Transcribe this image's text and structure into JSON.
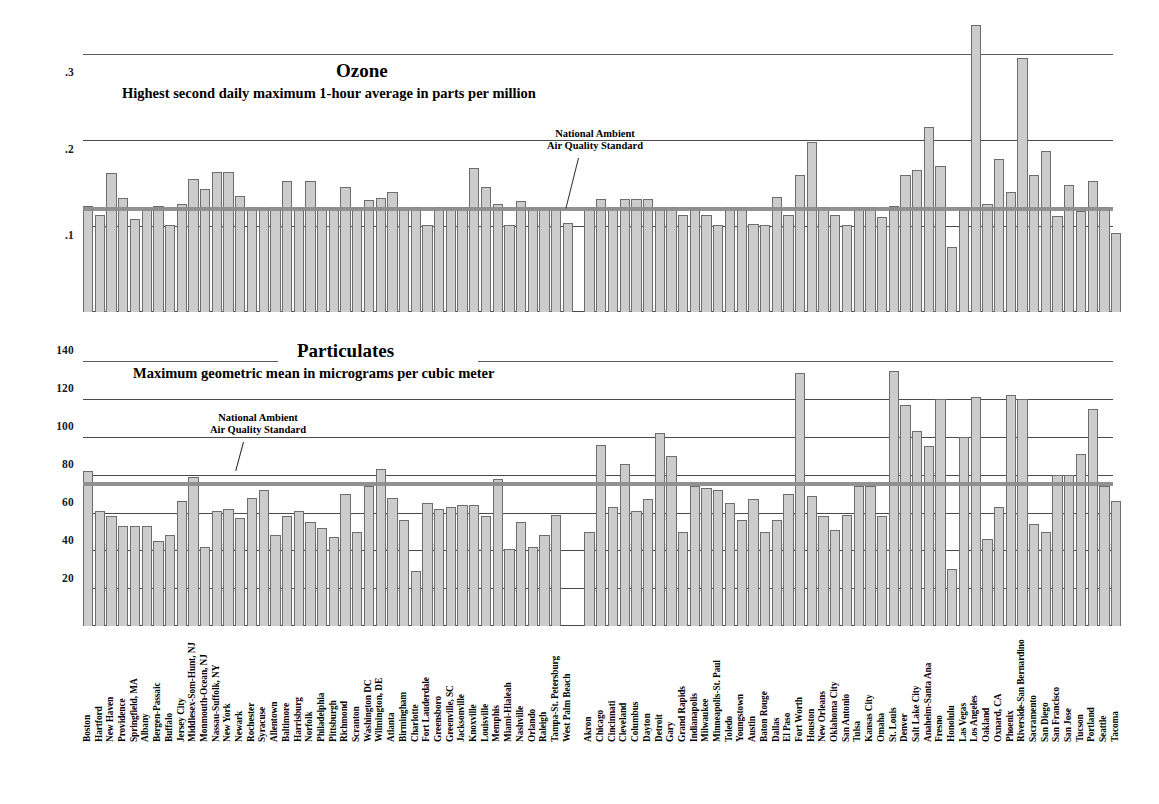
{
  "chart_data": [
    {
      "type": "bar",
      "title": "Ozone",
      "subtitle": "Highest second daily maximum 1-hour average in parts per million",
      "ylabel": "",
      "xlabel": "",
      "ylim": [
        0,
        0.34
      ],
      "yticks": [
        0.1,
        0.2,
        0.3
      ],
      "ytick_labels": [
        ".1",
        ".2",
        ".3"
      ],
      "grid": true,
      "annotation": "National Ambient\nAir Quality Standard",
      "annotation_lines": [
        "National Ambient",
        "Air Quality Standard"
      ],
      "reference_line": {
        "label": "National Ambient Air Quality Standard",
        "value": 0.12
      },
      "categories": [
        "Boston",
        "Hartford",
        "New Haven",
        "Providence",
        "Springfield, MA",
        "Albany",
        "Bergen-Passaic",
        "Buffalo",
        "Jersey City",
        "Middlesex-Som-Hunt, NJ",
        "Monmouth-Ocean, NJ",
        "Nassau-Suffolk, NY",
        "New York",
        "Newark",
        "Rochester",
        "Syracuse",
        "Allentown",
        "Baltimore",
        "Harrisburg",
        "Norfolk",
        "Philadelphia",
        "Pittsburgh",
        "Richmond",
        "Scranton",
        "Washington DC",
        "Wilmington, DE",
        "Atlanta",
        "Birmingham",
        "Charlotte",
        "Fort Lauderdale",
        "Greensboro",
        "Greenville, SC",
        "Jacksonville",
        "Knoxville",
        "Louisville",
        "Memphis",
        "Miami-Hialeah",
        "Nashville",
        "Orlando",
        "Raleigh",
        "Tampa-St. Petersburg",
        "West Palm Beach",
        "Akron",
        "Chicago",
        "Cincinnati",
        "Cleveland",
        "Columbus",
        "Dayton",
        "Detroit",
        "Gary",
        "Grand Rapids",
        "Indianapolis",
        "Milwaukee",
        "Minneapolis-St. Paul",
        "Toledo",
        "Youngstown",
        "Austin",
        "Baton Rouge",
        "Dallas",
        "El Paso",
        "Fort Worth",
        "Houston",
        "New Orleans",
        "Oklahoma City",
        "San Antonio",
        "Tulsa",
        "Kansas City",
        "Omaha",
        "St. Louis",
        "Denver",
        "Salt Lake City",
        "Anaheim-Santa Ana",
        "Fresno",
        "Honolulu",
        "Las Vegas",
        "Los Angeles",
        "Oakland",
        "Oxnard, CA",
        "Phoenix",
        "Riverside-San Bernardino",
        "Sacramento",
        "San Diego",
        "San Francisco",
        "San Jose",
        "Tucson",
        "Portland",
        "Seattle",
        "Tacoma"
      ],
      "values": [
        0.124,
        0.113,
        0.162,
        0.133,
        0.108,
        0.12,
        0.124,
        0.101,
        0.126,
        0.155,
        0.143,
        0.163,
        0.163,
        0.135,
        0.122,
        0.121,
        0.122,
        0.153,
        0.121,
        0.153,
        0.122,
        0.121,
        0.146,
        0.121,
        0.131,
        0.133,
        0.14,
        0.122,
        0.122,
        0.101,
        0.122,
        0.122,
        0.122,
        0.168,
        0.145,
        0.126,
        0.101,
        0.129,
        0.121,
        0.121,
        0.121,
        0.104,
        0.122,
        0.132,
        0.122,
        0.132,
        0.132,
        0.132,
        0.122,
        0.122,
        0.113,
        0.121,
        0.113,
        0.101,
        0.122,
        0.122,
        0.102,
        0.101,
        0.134,
        0.113,
        0.16,
        0.198,
        0.122,
        0.113,
        0.101,
        0.122,
        0.122,
        0.111,
        0.124,
        0.159,
        0.165,
        0.216,
        0.17,
        0.076,
        0.122,
        0.334,
        0.126,
        0.178,
        0.14,
        0.296,
        0.16,
        0.188,
        0.112,
        0.148,
        0.118,
        0.152,
        0.122,
        0.092
      ]
    },
    {
      "type": "bar",
      "title": "Particulates",
      "subtitle": "Maximum geometric mean in micrograms per cubic meter",
      "ylabel": "",
      "xlabel": "",
      "ylim": [
        0,
        145
      ],
      "yticks": [
        20,
        40,
        60,
        80,
        100,
        120,
        140
      ],
      "ytick_labels": [
        "20",
        "40",
        "60",
        "80",
        "100",
        "120",
        "140"
      ],
      "grid": true,
      "annotation": "National Ambient\nAir Quality Standard",
      "annotation_lines": [
        "National Ambient",
        "Air Quality Standard"
      ],
      "reference_line": {
        "label": "National Ambient Air Quality Standard",
        "value": 75
      },
      "categories": [
        "Boston",
        "Hartford",
        "New Haven",
        "Providence",
        "Springfield, MA",
        "Albany",
        "Bergen-Passaic",
        "Buffalo",
        "Jersey City",
        "Middlesex-Som-Hunt, NJ",
        "Monmouth-Ocean, NJ",
        "Nassau-Suffolk, NY",
        "New York",
        "Newark",
        "Rochester",
        "Syracuse",
        "Allentown",
        "Baltimore",
        "Harrisburg",
        "Norfolk",
        "Philadelphia",
        "Pittsburgh",
        "Richmond",
        "Scranton",
        "Washington DC",
        "Wilmington, DE",
        "Atlanta",
        "Birmingham",
        "Charlotte",
        "Fort Lauderdale",
        "Greensboro",
        "Greenville, SC",
        "Jacksonville",
        "Knoxville",
        "Louisville",
        "Memphis",
        "Miami-Hialeah",
        "Nashville",
        "Orlando",
        "Raleigh",
        "Tampa-St. Petersburg",
        "West Palm Beach",
        "Akron",
        "Chicago",
        "Cincinnati",
        "Cleveland",
        "Columbus",
        "Dayton",
        "Detroit",
        "Gary",
        "Grand Rapids",
        "Indianapolis",
        "Milwaukee",
        "Minneapolis-St. Paul",
        "Toledo",
        "Youngstown",
        "Austin",
        "Baton Rouge",
        "Dallas",
        "El Paso",
        "Fort Worth",
        "Houston",
        "New Orleans",
        "Oklahoma City",
        "San Antonio",
        "Tulsa",
        "Kansas City",
        "Omaha",
        "St. Louis",
        "Denver",
        "Salt Lake City",
        "Anaheim-Santa Ana",
        "Fresno",
        "Honolulu",
        "Las Vegas",
        "Los Angeles",
        "Oakland",
        "Oxnard, CA",
        "Phoenix",
        "Riverside-San Bernardino",
        "Sacramento",
        "San Diego",
        "San Francisco",
        "San Jose",
        "Tucson",
        "Portland",
        "Seattle",
        "Tacoma"
      ],
      "values": [
        82,
        61,
        58,
        53,
        53,
        53,
        45,
        48,
        66,
        79,
        42,
        61,
        62,
        57,
        68,
        72,
        48,
        58,
        61,
        55,
        52,
        47,
        70,
        50,
        74,
        83,
        68,
        56,
        29,
        65,
        62,
        63,
        64,
        64,
        58,
        78,
        41,
        55,
        42,
        48,
        59,
        null,
        50,
        96,
        63,
        86,
        61,
        67,
        102,
        90,
        50,
        74,
        73,
        72,
        65,
        56,
        67,
        50,
        56,
        70,
        134,
        69,
        58,
        51,
        59,
        74,
        74,
        58,
        135,
        117,
        103,
        95,
        120,
        30,
        100,
        121,
        46,
        63,
        122,
        120,
        54,
        50,
        80,
        80,
        91,
        115,
        74,
        66
      ]
    }
  ],
  "y_axis_ozone": {
    "ticks": [
      ".3",
      ".2",
      ".1"
    ]
  },
  "y_axis_particulates": {
    "ticks": [
      "140",
      "120",
      "100",
      "80",
      "60",
      "40",
      "20"
    ]
  }
}
